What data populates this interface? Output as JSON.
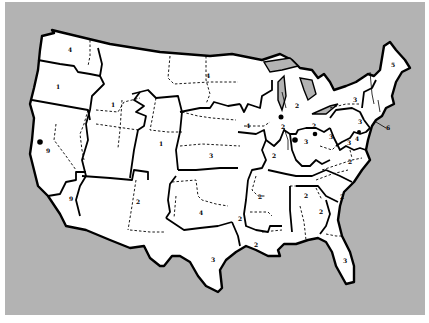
{
  "map": {
    "title": "",
    "background_color": "#b3b3b3",
    "land_color": "#ffffff",
    "outline_color": "#000000",
    "region_labels": [
      {
        "id": "wa",
        "text": "4",
        "x": 70,
        "y": 52
      },
      {
        "id": "or",
        "text": "1",
        "x": 58,
        "y": 87
      },
      {
        "id": "id",
        "text": "1",
        "x": 113,
        "y": 105
      },
      {
        "id": "mt-nd",
        "text": "4",
        "x": 208,
        "y": 76
      },
      {
        "id": "co",
        "text": "1",
        "x": 161,
        "y": 144
      },
      {
        "id": "ca-north",
        "text": "9",
        "x": 48,
        "y": 150
      },
      {
        "id": "ca-south",
        "text": "9",
        "x": 71,
        "y": 199
      },
      {
        "id": "ks",
        "text": "3",
        "x": 211,
        "y": 156
      },
      {
        "id": "az-nm",
        "text": "2",
        "x": 138,
        "y": 202
      },
      {
        "id": "ok",
        "text": "4",
        "x": 201,
        "y": 213
      },
      {
        "id": "tx",
        "text": "3",
        "x": 213,
        "y": 260
      },
      {
        "id": "mi",
        "text": "2",
        "x": 297,
        "y": 106
      },
      {
        "id": "ia",
        "text": "4",
        "x": 248,
        "y": 126
      },
      {
        "id": "il-dot",
        "text": "2",
        "x": 282,
        "y": 127
      },
      {
        "id": "oh",
        "text": "2",
        "x": 314,
        "y": 126
      },
      {
        "id": "in",
        "text": "3",
        "x": 306,
        "y": 142
      },
      {
        "id": "mo",
        "text": "2",
        "x": 274,
        "y": 156
      },
      {
        "id": "ar",
        "text": "2",
        "x": 260,
        "y": 197
      },
      {
        "id": "tn-ky",
        "text": "2",
        "x": 240,
        "y": 219
      },
      {
        "id": "la",
        "text": "2",
        "x": 256,
        "y": 245
      },
      {
        "id": "ny",
        "text": "3",
        "x": 355,
        "y": 100
      },
      {
        "id": "me",
        "text": "5",
        "x": 393,
        "y": 65
      },
      {
        "id": "pa",
        "text": "3",
        "x": 360,
        "y": 122
      },
      {
        "id": "ma-coast",
        "text": "6",
        "x": 388,
        "y": 128
      },
      {
        "id": "wv",
        "text": "3",
        "x": 331,
        "y": 137
      },
      {
        "id": "va",
        "text": "3",
        "x": 349,
        "y": 143
      },
      {
        "id": "md",
        "text": "4",
        "x": 357,
        "y": 139
      },
      {
        "id": "nc",
        "text": "2",
        "x": 350,
        "y": 162
      },
      {
        "id": "sc",
        "text": "2",
        "x": 342,
        "y": 197
      },
      {
        "id": "ga",
        "text": "2",
        "x": 321,
        "y": 212
      },
      {
        "id": "ms-al",
        "text": "2",
        "x": 306,
        "y": 196
      },
      {
        "id": "fl",
        "text": "3",
        "x": 345,
        "y": 261
      }
    ],
    "city_markers": [
      {
        "id": "san-francisco",
        "x": 40,
        "y": 142
      },
      {
        "id": "chicago",
        "x": 281,
        "y": 117
      },
      {
        "id": "indianapolis",
        "x": 295,
        "y": 140
      },
      {
        "id": "columbus",
        "x": 315,
        "y": 134
      },
      {
        "id": "baltimore",
        "x": 359,
        "y": 132
      }
    ]
  }
}
